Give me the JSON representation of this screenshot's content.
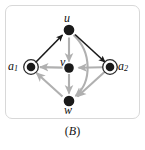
{
  "figure": {
    "caption_open": "(",
    "caption_text": "B",
    "caption_close": ")",
    "panel_border_color": "#d8d8d8",
    "background_color": "#ffffff"
  },
  "colors": {
    "node_fill": "#1a1a1a",
    "accept_ring": "#2b2b2b",
    "edge_black": "#1a1a1a",
    "edge_gray": "#b0b0b0",
    "label_color": "#111111"
  },
  "graph": {
    "type": "directed-graph",
    "nodes": [
      {
        "id": "u",
        "label": "u",
        "sub": "",
        "x": 69,
        "y": 30,
        "r": 5.5,
        "shape": "filled-circle",
        "label_pos": "above"
      },
      {
        "id": "v",
        "label": "v",
        "sub": "",
        "x": 69,
        "y": 68,
        "r": 5.0,
        "shape": "filled-circle",
        "label_pos": "above-left"
      },
      {
        "id": "w",
        "label": "w",
        "sub": "",
        "x": 69,
        "y": 101,
        "r": 5.5,
        "shape": "filled-circle",
        "label_pos": "below"
      },
      {
        "id": "a1",
        "label": "a",
        "sub": "1",
        "x": 31,
        "y": 67,
        "r": 4.5,
        "shape": "double-circle",
        "label_pos": "left"
      },
      {
        "id": "a2",
        "label": "a",
        "sub": "2",
        "x": 110,
        "y": 67,
        "r": 4.5,
        "shape": "double-circle",
        "label_pos": "right"
      }
    ],
    "edges": [
      {
        "id": "a1-u",
        "from": "a1",
        "to": "u",
        "color": "black",
        "style": "straight",
        "arrow": "to"
      },
      {
        "id": "u-a2",
        "from": "u",
        "to": "a2",
        "color": "black",
        "style": "straight",
        "arrow": "to"
      },
      {
        "id": "u-v",
        "from": "u",
        "to": "v",
        "color": "gray",
        "style": "straight",
        "arrow": "to"
      },
      {
        "id": "v-w",
        "from": "v",
        "to": "w",
        "color": "gray",
        "style": "straight",
        "arrow": "to"
      },
      {
        "id": "v-a1",
        "from": "v",
        "to": "a1",
        "color": "gray",
        "style": "straight",
        "arrow": "to"
      },
      {
        "id": "a2-v",
        "from": "a2",
        "to": "v",
        "color": "gray",
        "style": "straight",
        "arrow": "to"
      },
      {
        "id": "a2-w",
        "from": "a2",
        "to": "w",
        "color": "gray",
        "style": "straight",
        "arrow": "to"
      },
      {
        "id": "w-a1",
        "from": "w",
        "to": "a1",
        "color": "gray",
        "style": "straight",
        "arrow": "to"
      },
      {
        "id": "u-w",
        "from": "u",
        "to": "w",
        "color": "gray",
        "style": "curved-right",
        "arrow": "to"
      }
    ]
  }
}
